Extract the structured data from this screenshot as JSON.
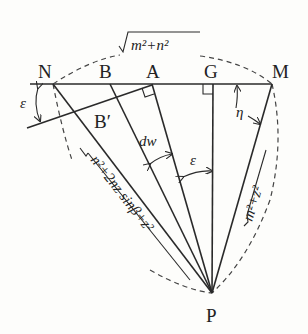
{
  "figure": {
    "type": "geometric-diagram",
    "points": {
      "N": "N",
      "B": "B",
      "A": "A",
      "G": "G",
      "M": "M",
      "B_prime": "B′",
      "P": "P"
    },
    "angle_labels": {
      "epsilon_left": "ε",
      "epsilon_mid": "ε",
      "eta": "η",
      "dw": "dw"
    },
    "length_labels": {
      "top": "m²+n²",
      "left": "n²+2nz sinβ+z²",
      "right": "m²+z²"
    },
    "colors": {
      "ink": "#2a2a2a",
      "background": "#fdfdfb"
    }
  }
}
